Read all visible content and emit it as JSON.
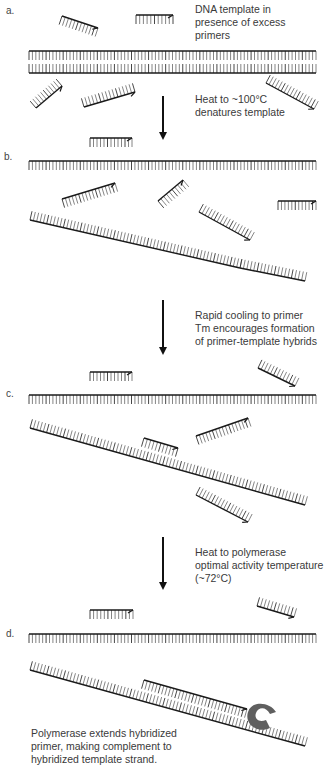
{
  "steps": [
    {
      "label": "a.",
      "caption": "DNA template in\npresence of excess\nprimers"
    },
    {
      "label": "b.",
      "caption": "Heat to ~100°C\ndenatures template"
    },
    {
      "label": "c.",
      "caption": "Rapid cooling to primer\nTm encourages formation\nof primer-template hybrids"
    },
    {
      "label": "d.",
      "caption": "Heat to polymerase\noptimal activity temperature\n(~72°C)"
    }
  ],
  "final_caption": "Polymerase extends hybridized\nprimer, making complement to\nhybridized template strand.",
  "colors": {
    "strand": "#1a1a1a",
    "base": "#777777",
    "polymerase": "#5f5f5f"
  }
}
